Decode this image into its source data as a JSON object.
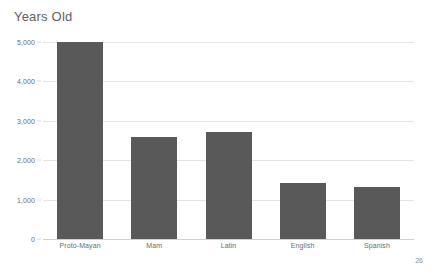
{
  "slide": {
    "page_number": "26",
    "background_color": "#ffffff"
  },
  "chart_data": {
    "type": "bar",
    "title": "Years Old",
    "xlabel": "",
    "ylabel": "",
    "categories": [
      "Proto-Mayan",
      "Mam",
      "Latin",
      "English",
      "Spanish"
    ],
    "values": [
      5000,
      2600,
      2720,
      1430,
      1330
    ],
    "ylim": [
      0,
      5000
    ],
    "yticks": [
      0,
      1000,
      2000,
      3000,
      4000,
      5000
    ],
    "ytick_labels": [
      "0",
      "1,000",
      "2,000",
      "3,000",
      "4,000",
      "5,000"
    ],
    "grid": true,
    "legend": false,
    "bar_color": "#595959",
    "gridline_color": "#e4e4e4",
    "axis_color": "#d0d0d0",
    "label_color": "#6b6b6b",
    "title_color": "#5f5f5f"
  }
}
